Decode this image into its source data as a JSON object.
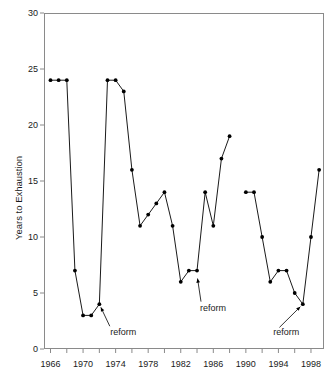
{
  "chart_data": {
    "type": "line",
    "title": "",
    "subtitle": "",
    "xlabel": "",
    "ylabel": "Years to Exhaustion",
    "xlim": [
      1965.2,
      1999.6
    ],
    "ylim": [
      0,
      30
    ],
    "grid": false,
    "legend": null,
    "marker": "filled-circle",
    "line_color": "#000000",
    "marker_color": "#000000",
    "y_ticks": [
      0,
      5,
      10,
      15,
      20,
      25,
      30
    ],
    "y_tick_labels": [
      "0",
      "5",
      "10",
      "15",
      "20",
      "25",
      "30"
    ],
    "x_ticks": [
      1966,
      1968,
      1970,
      1972,
      1974,
      1976,
      1978,
      1980,
      1982,
      1984,
      1986,
      1988,
      1990,
      1992,
      1994,
      1996,
      1998
    ],
    "x_tick_labels_shown": [
      "1966",
      "1970",
      "1974",
      "1978",
      "1982",
      "1986",
      "1990",
      "1994",
      "1998"
    ],
    "x_tick_labels_shown_at": [
      1966,
      1970,
      1974,
      1978,
      1982,
      1986,
      1990,
      1994,
      1998
    ],
    "segments": [
      {
        "name": "1966-1988",
        "x": [
          1966,
          1967,
          1968,
          1969,
          1970,
          1971,
          1972,
          1973,
          1974,
          1975,
          1976,
          1977,
          1978,
          1979,
          1980,
          1981,
          1982,
          1983,
          1984,
          1985,
          1986,
          1987,
          1988
        ],
        "y": [
          24,
          24,
          24,
          7,
          3,
          3,
          4,
          24,
          24,
          23,
          16,
          11,
          12,
          13,
          14,
          11,
          6,
          7,
          7,
          14,
          11,
          17,
          19
        ]
      },
      {
        "name": "1990-1999",
        "x": [
          1990,
          1991,
          1992,
          1993,
          1994,
          1995,
          1996,
          1997,
          1998,
          1999
        ],
        "y": [
          14,
          14,
          10,
          6,
          7,
          7,
          5,
          4,
          10,
          16
        ]
      }
    ],
    "annotations": [
      {
        "text": "reform",
        "point_x": 1972,
        "point_y": 4,
        "label_x": 1973.6,
        "label_y": 1.55
      },
      {
        "text": "reform",
        "point_x": 1984,
        "point_y": 6.6,
        "label_x": 1984.6,
        "label_y": 3.7
      },
      {
        "text": "reform",
        "point_x": 1997,
        "point_y": 4,
        "label_x": 1993.6,
        "label_y": 1.55
      }
    ]
  }
}
